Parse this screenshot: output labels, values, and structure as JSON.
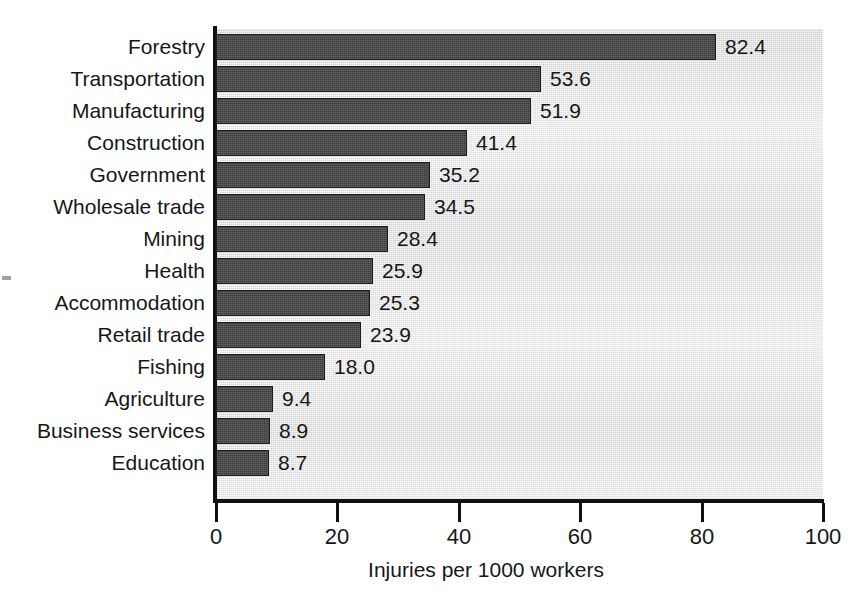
{
  "chart_data": {
    "type": "bar",
    "orientation": "horizontal",
    "title": "",
    "xlabel": "Injuries per 1000 workers",
    "ylabel": "",
    "xlim": [
      0,
      100
    ],
    "xticks": [
      0,
      20,
      40,
      60,
      80,
      100
    ],
    "xtick_labels": [
      "0",
      "20",
      "40",
      "60",
      "80",
      "100"
    ],
    "grid": false,
    "legend": null,
    "bar_color": "#3c3c3c",
    "plot_background": "#dedede",
    "page_background": "#ffffff",
    "categories": [
      "Forestry",
      "Transportation",
      "Manufacturing",
      "Construction",
      "Government",
      "Wholesale trade",
      "Mining",
      "Health",
      "Accommodation",
      "Retail trade",
      "Fishing",
      "Agriculture",
      "Business services",
      "Education"
    ],
    "values": [
      82.4,
      53.6,
      51.9,
      41.4,
      35.2,
      34.5,
      28.4,
      25.9,
      25.3,
      23.9,
      18.0,
      9.4,
      8.9,
      8.7
    ],
    "value_labels": [
      "82.4",
      "53.6",
      "51.9",
      "41.4",
      "35.2",
      "34.5",
      "28.4",
      "25.9",
      "25.3",
      "23.9",
      "18.0",
      "9.4",
      "8.9",
      "8.7"
    ]
  }
}
